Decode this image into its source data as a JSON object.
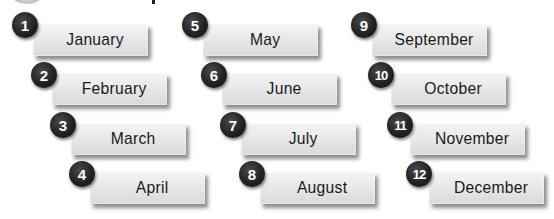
{
  "months": [
    {
      "number": "1",
      "name": "January"
    },
    {
      "number": "2",
      "name": "February"
    },
    {
      "number": "3",
      "name": "March"
    },
    {
      "number": "4",
      "name": "April"
    },
    {
      "number": "5",
      "name": "May"
    },
    {
      "number": "6",
      "name": "June"
    },
    {
      "number": "7",
      "name": "July"
    },
    {
      "number": "8",
      "name": "August"
    },
    {
      "number": "9",
      "name": "September"
    },
    {
      "number": "10",
      "name": "October"
    },
    {
      "number": "11",
      "name": "November"
    },
    {
      "number": "12",
      "name": "December"
    }
  ],
  "colors": {
    "badge": "#222222",
    "label_top": "#f4f4f4",
    "label_bottom": "#d9d9d9",
    "text": "#1a1a1a"
  }
}
